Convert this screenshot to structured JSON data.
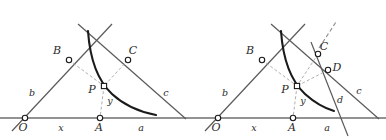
{
  "figure": {
    "type": "geometry-diagram",
    "title": "",
    "panels": [
      {
        "id": "left",
        "name": "left-diagram",
        "points": [
          {
            "key": "O",
            "label": "O",
            "x": 25,
            "y": 118,
            "marker": "circle",
            "label_x": 23,
            "label_y": 131
          },
          {
            "key": "A",
            "label": "A",
            "x": 100,
            "y": 118,
            "marker": "circle",
            "label_x": 97,
            "label_y": 131
          },
          {
            "key": "B",
            "label": "B",
            "x": 69,
            "y": 60,
            "marker": "circle",
            "label_x": 56,
            "label_y": 54
          },
          {
            "key": "C",
            "label": "C",
            "x": 128,
            "y": 60,
            "marker": "circle",
            "label_x": 130,
            "label_y": 54
          },
          {
            "key": "P",
            "label": "P",
            "x": 104,
            "y": 86,
            "marker": "square",
            "label_x": 90,
            "label_y": 92
          }
        ],
        "segment_labels": [
          {
            "key": "b",
            "label": "b",
            "x": 32,
            "y": 95
          },
          {
            "key": "c",
            "label": "c",
            "x": 165,
            "y": 95
          },
          {
            "key": "x",
            "label": "x",
            "x": 60,
            "y": 130
          },
          {
            "key": "a",
            "label": "a",
            "x": 140,
            "y": 130
          },
          {
            "key": "y",
            "label": "y",
            "x": 110,
            "y": 103
          }
        ],
        "has_line_d": false,
        "has_point_D": false,
        "has_dashed_ray": false
      },
      {
        "id": "right",
        "name": "right-diagram",
        "points": [
          {
            "key": "O",
            "label": "O",
            "x": 25,
            "y": 118,
            "marker": "circle",
            "label_x": 23,
            "label_y": 131
          },
          {
            "key": "A",
            "label": "A",
            "x": 100,
            "y": 118,
            "marker": "circle",
            "label_x": 97,
            "label_y": 131
          },
          {
            "key": "B",
            "label": "B",
            "x": 69,
            "y": 60,
            "marker": "circle",
            "label_x": 56,
            "label_y": 54
          },
          {
            "key": "C",
            "label": "C",
            "x": 125,
            "y": 54,
            "marker": "circle",
            "label_x": 128,
            "label_y": 50
          },
          {
            "key": "D",
            "label": "D",
            "x": 135,
            "y": 70,
            "marker": "circle",
            "label_x": 140,
            "label_y": 70
          },
          {
            "key": "P",
            "label": "P",
            "x": 104,
            "y": 86,
            "marker": "square",
            "label_x": 90,
            "label_y": 92
          }
        ],
        "segment_labels": [
          {
            "key": "b",
            "label": "b",
            "x": 32,
            "y": 95
          },
          {
            "key": "c",
            "label": "c",
            "x": 165,
            "y": 93
          },
          {
            "key": "d",
            "label": "d",
            "x": 147,
            "y": 102
          },
          {
            "key": "x",
            "label": "x",
            "x": 60,
            "y": 130
          },
          {
            "key": "a",
            "label": "a",
            "x": 133,
            "y": 130
          },
          {
            "key": "y",
            "label": "y",
            "x": 110,
            "y": 103
          }
        ],
        "has_line_d": true,
        "has_point_D": true,
        "has_dashed_ray": true
      }
    ],
    "colors": {
      "stroke_solid": "#4a4a4a",
      "stroke_curve": "#1a1a1a",
      "stroke_dashed": "#9a9a9a",
      "baseline": "#6e6e6e",
      "marker_fill": "#ffffff",
      "marker_stroke": "#1a1a1a",
      "label_fill": "#2b2b2b",
      "background": "#ffffff"
    }
  }
}
